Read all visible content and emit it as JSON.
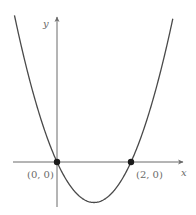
{
  "chart_data": {
    "type": "line",
    "title": "",
    "xlabel": "x",
    "ylabel": "y",
    "function": "y = x^2 - 2x",
    "x_range": [
      -1.2,
      3.2
    ],
    "y_range": [
      -1,
      3.6
    ],
    "grid": false,
    "legend": null,
    "series": [
      {
        "name": "parabola",
        "x": [
          -1.1,
          -1,
          -0.5,
          0,
          0.5,
          1,
          1.5,
          2,
          2.5,
          3,
          3.1
        ],
        "y": [
          3.41,
          3,
          1.25,
          0,
          -0.75,
          -1,
          -0.75,
          0,
          1.25,
          3,
          3.41
        ]
      }
    ],
    "points": [
      {
        "x": 0,
        "y": 0,
        "label": "(0, 0)"
      },
      {
        "x": 2,
        "y": 0,
        "label": "(2, 0)"
      }
    ],
    "annotations": [
      "(0, 0)",
      "(2, 0)"
    ]
  },
  "axes": {
    "x_label": "x",
    "y_label": "y"
  },
  "points": {
    "p1_label": "(0, 0)",
    "p2_label": "(2, 0)"
  },
  "colors": {
    "curve": "#4a4a4a",
    "axes": "#6a6a6a",
    "points": "#1a1a1a"
  }
}
